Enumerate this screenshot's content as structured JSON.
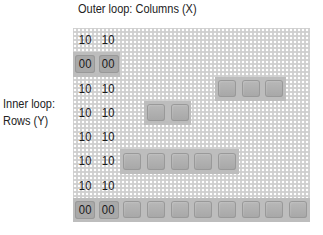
{
  "labels": {
    "outer": "Outer loop: Columns (X)",
    "inner_line1": "Inner loop:",
    "inner_line2": "Rows (Y)"
  },
  "grid": {
    "columns": 10,
    "rows": [
      {
        "codes": [
          "10",
          "10"
        ],
        "code_blocks": false,
        "blocks": []
      },
      {
        "codes": [
          "00",
          "00"
        ],
        "code_blocks": true,
        "blocks": []
      },
      {
        "codes": [
          "10",
          "10"
        ],
        "code_blocks": false,
        "blocks": [
          6,
          7,
          8
        ]
      },
      {
        "codes": [
          "10",
          "10"
        ],
        "code_blocks": false,
        "blocks": [
          3,
          4
        ]
      },
      {
        "codes": [
          "10",
          "10"
        ],
        "code_blocks": false,
        "blocks": []
      },
      {
        "codes": [
          "10",
          "10"
        ],
        "code_blocks": false,
        "blocks": [
          2,
          3,
          4,
          5,
          6
        ]
      },
      {
        "codes": [
          "10",
          "10"
        ],
        "code_blocks": false,
        "blocks": []
      },
      {
        "codes": [
          "00",
          "00"
        ],
        "code_blocks": true,
        "blocks": [
          2,
          3,
          4,
          5,
          6,
          7,
          8,
          9
        ]
      }
    ]
  },
  "colors": {
    "grid_bg": "#cfcfcf",
    "dot": "#ffffff",
    "block": "#ababab"
  }
}
